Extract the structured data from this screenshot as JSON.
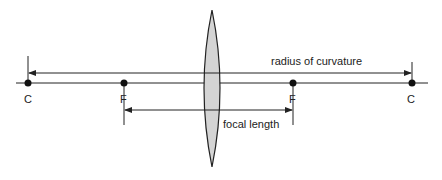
{
  "diagram": {
    "type": "converging-lens",
    "labels": {
      "radius_of_curvature": "radius of curvature",
      "focal_length": "focal length",
      "left_center": "C",
      "right_center": "C",
      "left_focus": "F",
      "right_focus": "F"
    },
    "colors": {
      "line": "#222222",
      "lens_fill": "#d4d4d4"
    }
  }
}
